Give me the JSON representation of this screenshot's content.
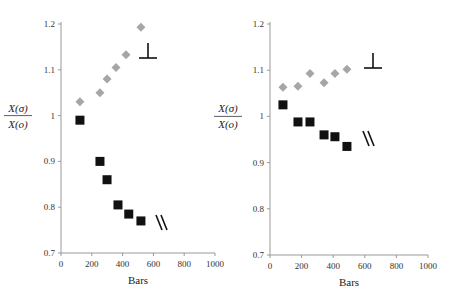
{
  "chart_data": [
    {
      "type": "scatter",
      "title": "",
      "xlabel": "Bars",
      "ylabel": "X(σ) / X(o)",
      "xlim": [
        0,
        1000
      ],
      "ylim": [
        0.7,
        1.2
      ],
      "xticks": [
        "0",
        "200",
        "400",
        "600",
        "800",
        "1000"
      ],
      "yticks": [
        "0.7",
        "0.8",
        "0.9",
        "1",
        "1.1",
        "1.2"
      ],
      "grid": false,
      "annotations": [
        "⊥",
        "//"
      ],
      "series": [
        {
          "name": "perpendicular (⊥)",
          "marker": "diamond",
          "color": "#a6a6a6",
          "x": [
            123,
            253,
            299,
            357,
            422,
            519
          ],
          "y": [
            1.03,
            1.05,
            1.08,
            1.105,
            1.133,
            1.193
          ]
        },
        {
          "name": "parallel (//)",
          "marker": "square",
          "color": "#111111",
          "x": [
            123,
            253,
            299,
            370,
            440,
            519
          ],
          "y": [
            0.99,
            0.9,
            0.86,
            0.805,
            0.785,
            0.77
          ]
        }
      ]
    },
    {
      "type": "scatter",
      "title": "",
      "xlabel": "Bars",
      "ylabel": "X(σ) / X(o)",
      "xlim": [
        0,
        1000
      ],
      "ylim": [
        0.7,
        1.2
      ],
      "xticks": [
        "0",
        "200",
        "400",
        "600",
        "800",
        "1000"
      ],
      "yticks": [
        "0.7",
        "0.8",
        "0.9",
        "1",
        "1.1",
        "1.2"
      ],
      "grid": false,
      "annotations": [
        "⊥",
        "//"
      ],
      "series": [
        {
          "name": "perpendicular (⊥)",
          "marker": "diamond",
          "color": "#a6a6a6",
          "x": [
            82,
            177,
            253,
            342,
            411,
            487
          ],
          "y": [
            1.063,
            1.065,
            1.093,
            1.073,
            1.093,
            1.102
          ]
        },
        {
          "name": "parallel (//)",
          "marker": "square",
          "color": "#111111",
          "x": [
            82,
            177,
            253,
            342,
            411,
            487
          ],
          "y": [
            1.025,
            0.988,
            0.988,
            0.96,
            0.956,
            0.935
          ]
        }
      ]
    }
  ],
  "labels": {
    "num": "X(σ)",
    "den": "X(o)",
    "xlabel": "Bars",
    "perp": "⊥",
    "par": "\\\\"
  }
}
